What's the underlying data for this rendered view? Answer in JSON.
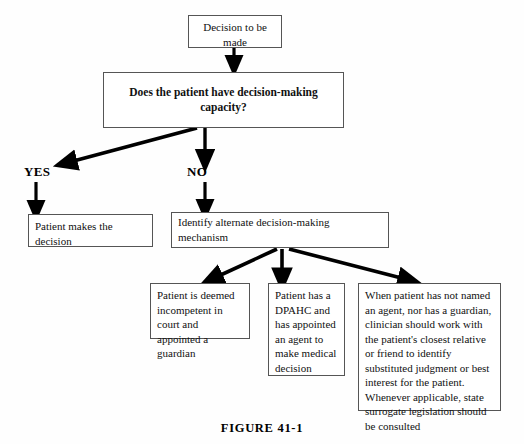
{
  "figure": {
    "caption": "FIGURE 41-1"
  },
  "nodes": {
    "start": {
      "label": "Decision to be made"
    },
    "question": {
      "label": "Does the patient have decision-making capacity?"
    },
    "patient_decides": {
      "label": "Patient makes the decision"
    },
    "identify_alternate": {
      "label": "Identify alternate decision-making mechanism"
    },
    "incompetent": {
      "label": "Patient is deemed incompetent in court and appointed a guardian"
    },
    "dpahc": {
      "label": "Patient has a DPAHC and has appointed an agent to make medical decision"
    },
    "surrogate": {
      "label": "When patient has not named an agent, nor has a guardian, clinician should work with the patient's closest relative or friend to identify substituted judgment or best interest for the patient. Whenever applicable, state surrogate legislation should be consulted"
    }
  },
  "edge_labels": {
    "yes": "YES",
    "no": "NO"
  },
  "colors": {
    "background": "#fefefe",
    "box_border": "#555555",
    "text": "#111111",
    "arrow": "#000000"
  }
}
